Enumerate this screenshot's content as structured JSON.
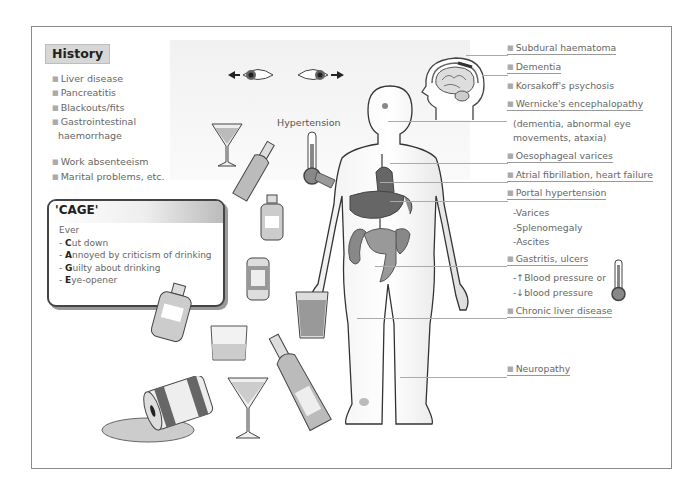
{
  "history": {
    "title": "History",
    "items": [
      "Liver disease",
      "Pancreatitis",
      "Blackouts/fits",
      "Gastrointestinal",
      "haemorrhage"
    ],
    "items2": [
      "Work absenteeism",
      "Marital problems, etc."
    ]
  },
  "cage": {
    "title": "'CAGE'",
    "intro": "Ever",
    "lines": [
      {
        "prefix": "- ",
        "key": "C",
        "rest": "ut down"
      },
      {
        "prefix": "- ",
        "key": "A",
        "rest": "nnoyed by criticism of drinking"
      },
      {
        "prefix": "- ",
        "key": "G",
        "rest": "uilty about drinking"
      },
      {
        "prefix": "- ",
        "key": "E",
        "rest": "ye-opener"
      }
    ]
  },
  "body_labels": {
    "hypertension": "Hypertension"
  },
  "right_labels": {
    "subdural": "Subdural haematoma",
    "dementia": "Dementia",
    "korsakoff": "Korsakoff's psychosis",
    "wernicke": "Wernicke's encephalopathy",
    "wernicke_detail1": "(dementia, abnormal eye",
    "wernicke_detail2": "movements, ataxia)",
    "oesophageal": "Oesophageal varices",
    "atrial": "Atrial fibrillation, heart failure",
    "portal": "Portal hypertension",
    "portal_sub": [
      "-Varices",
      "-Splenomegaly",
      "-Ascites"
    ],
    "gastritis": "Gastritis, ulcers",
    "bp_up": "-↑Blood pressure or",
    "bp_down": "-↓blood pressure",
    "chronic_liver": "Chronic liver disease",
    "neuropathy": "Neuropathy"
  },
  "icons": [
    "eyes-nystagmus-icon",
    "head-brain-icon",
    "thermometer-icon",
    "body-figure-icon",
    "cocktail-glass-icon",
    "wine-bottle-icon",
    "flask-bottle-icon",
    "beer-can-icon",
    "tumbler-glass-icon",
    "pint-glass-icon",
    "spilled-can-icon"
  ],
  "colors": {
    "frame": "#8a8a8a",
    "text": "#666666",
    "header_bg": "#d7d7d7",
    "organ": "#777777"
  }
}
